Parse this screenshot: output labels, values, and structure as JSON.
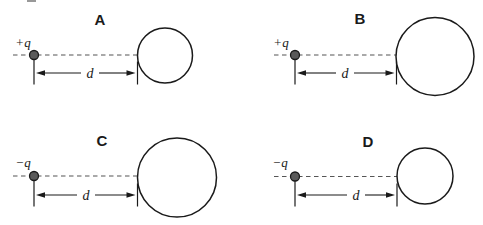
{
  "figure": {
    "background": "#ffffff",
    "ink": "#1a1a1a",
    "dash_color": "#555555",
    "charge_dot_fill": "#5a5a5a",
    "artifact": {
      "x": 27,
      "y": 0,
      "w": 9,
      "h": 2,
      "color": "#999999"
    }
  },
  "panels": [
    {
      "label": "A",
      "charge_label": "+q",
      "distance_label": "d",
      "sphere_size": "small",
      "geometry": {
        "label_x": 100,
        "label_y": 25,
        "charge_label_x": 23,
        "charge_label_y": 47,
        "dot_x": 34,
        "dot_y": 55,
        "dot_r": 4.5,
        "dash_x1": 13,
        "dash_x2": 137.5,
        "circle_cx": 165,
        "circle_cy": 55.5,
        "circle_r": 27.5,
        "dim_y": 73,
        "dim_x1": 34,
        "dim_x2": 137.5,
        "d_x": 90,
        "d_y": 78
      }
    },
    {
      "label": "B",
      "charge_label": "+q",
      "distance_label": "d",
      "sphere_size": "large",
      "geometry": {
        "label_x": 360,
        "label_y": 24,
        "charge_label_x": 281,
        "charge_label_y": 47,
        "dot_x": 295,
        "dot_y": 55,
        "dot_r": 4.5,
        "dash_x1": 274,
        "dash_x2": 396.5,
        "circle_cx": 435,
        "circle_cy": 56.5,
        "circle_r": 39,
        "dim_y": 73,
        "dim_x1": 295,
        "dim_x2": 396.5,
        "d_x": 345,
        "d_y": 78
      }
    },
    {
      "label": "C",
      "charge_label": "−q",
      "distance_label": "d",
      "sphere_size": "large",
      "geometry": {
        "label_x": 102,
        "label_y": 146,
        "charge_label_x": 23,
        "charge_label_y": 167,
        "dot_x": 34,
        "dot_y": 176,
        "dot_r": 4.5,
        "dash_x1": 13,
        "dash_x2": 137.5,
        "circle_cx": 177,
        "circle_cy": 177.5,
        "circle_r": 39.5,
        "dim_y": 195,
        "dim_x1": 34,
        "dim_x2": 137.5,
        "d_x": 86,
        "d_y": 200
      }
    },
    {
      "label": "D",
      "charge_label": "−q",
      "distance_label": "d",
      "sphere_size": "small",
      "geometry": {
        "label_x": 368,
        "label_y": 147,
        "charge_label_x": 280,
        "charge_label_y": 167,
        "dot_x": 295,
        "dot_y": 176.5,
        "dot_r": 4.5,
        "dash_x1": 274,
        "dash_x2": 397,
        "circle_cx": 425,
        "circle_cy": 176,
        "circle_r": 28,
        "dim_y": 195,
        "dim_x1": 295,
        "dim_x2": 397,
        "d_x": 356,
        "d_y": 200
      }
    }
  ]
}
